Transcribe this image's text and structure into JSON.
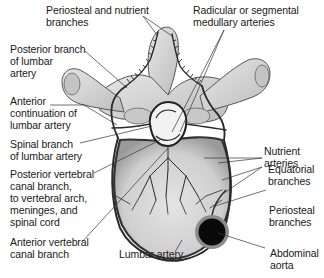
{
  "diagram": {
    "labels": {
      "periosteal_nutrient": [
        "Periosteal and nutrient",
        "branches"
      ],
      "radicular": [
        "Radicular or segmental",
        "medullary arteries"
      ],
      "posterior_branch": [
        "Posterior branch",
        "of lumbar",
        "artery"
      ],
      "anterior_continuation": [
        "Anterior",
        "continuation of",
        "lumbar artery"
      ],
      "spinal_branch": [
        "Spinal branch",
        "of lumbar artery"
      ],
      "posterior_vertebral_canal": [
        "Posterior vertebral",
        "canal branch,",
        "to vertebral arch,",
        "meninges, and",
        "spinal cord"
      ],
      "anterior_vertebral_canal": [
        "Anterior vertebral",
        "canal branch"
      ],
      "lumbar_artery": [
        "Lumbar artery"
      ],
      "nutrient_arteries": [
        "Nutrient",
        "arteries"
      ],
      "equatorial_branches": [
        "Equatorial",
        "branches"
      ],
      "periosteal_branches": [
        "Periosteal",
        "branches"
      ],
      "abdominal_aorta": [
        "Abdominal",
        "aorta"
      ]
    },
    "colors": {
      "bone_fill": "#d6d6d6",
      "bone_shade": "#a8a8a8",
      "artery": "#2a2a2a",
      "aorta_fill": "#0a0a0a",
      "aorta_ring": "#8c8c8c",
      "leader_line": "#333333"
    }
  }
}
